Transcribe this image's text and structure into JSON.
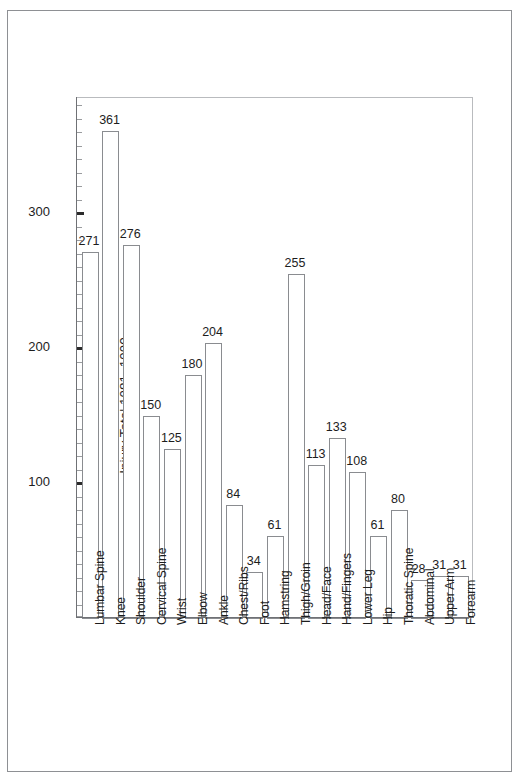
{
  "chart_data": {
    "type": "bar",
    "title": "",
    "subtitle": "",
    "xlabel": "",
    "ylabel": "Injury Total 1981–1990",
    "ylim": [
      0,
      385
    ],
    "ytick_labels": [
      "100",
      "200",
      "300"
    ],
    "ytick_values": [
      100,
      200,
      300
    ],
    "minor_tick_step": 10,
    "grid": false,
    "legend": null,
    "bar_style": "open/unfilled rectangles with thin gray outline",
    "categories": [
      "Lumbar Spine",
      "Knee",
      "Shoulder",
      "Cervical Spine",
      "Wrist",
      "Elbow",
      "Ankle",
      "Chest/Ribs",
      "Foot",
      "Hamstring",
      "Thigh/Groin",
      "Head/Face",
      "Hand/Fingers",
      "Lower Leg",
      "Hip",
      "Thoratic Spine",
      "Abdominal",
      "Upper Arm",
      "Forearm"
    ],
    "values": [
      271,
      361,
      276,
      150,
      125,
      180,
      204,
      84,
      34,
      61,
      255,
      113,
      133,
      108,
      61,
      80,
      28,
      31,
      31
    ],
    "data_labels": [
      "271",
      "361",
      "276",
      "150",
      "125",
      "180",
      "204",
      "84",
      "34",
      "61",
      "255",
      "113",
      "133",
      "108",
      "61",
      "80",
      "28",
      "31",
      "31"
    ]
  },
  "colors": {
    "background": "#ffffff",
    "frame": "#8e9094",
    "axis": "#6f7175",
    "bar_outline": "#8a8c90",
    "text": "#1d1d1d",
    "tick_minor": "#9a9c9f"
  }
}
